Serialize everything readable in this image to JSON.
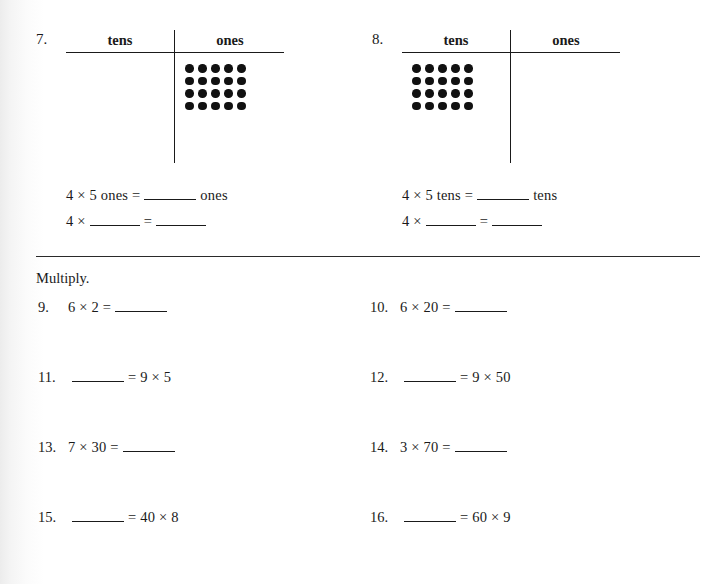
{
  "worksheet": {
    "place_value_problems": [
      {
        "number": "7.",
        "columns": {
          "tens": "tens",
          "ones": "ones"
        },
        "dots": {
          "placed_in": "ones",
          "rows": 4,
          "cols": 5,
          "total": 20
        },
        "equations": [
          {
            "lead": "4 × 5 ones =",
            "blank1": "",
            "trailer": "ones"
          },
          {
            "lead": "4 ×",
            "blank1": "",
            "mid": "=",
            "blank2": ""
          }
        ]
      },
      {
        "number": "8.",
        "columns": {
          "tens": "tens",
          "ones": "ones"
        },
        "dots": {
          "placed_in": "tens",
          "rows": 4,
          "cols": 5,
          "total": 20
        },
        "equations": [
          {
            "lead": "4 × 5 tens =",
            "blank1": "",
            "trailer": "tens"
          },
          {
            "lead": "4 ×",
            "blank1": "",
            "mid": "=",
            "blank2": ""
          }
        ]
      }
    ],
    "multiply_section": {
      "instruction": "Multiply.",
      "problems": [
        {
          "number": "9.",
          "before_blank": "6 × 2 =",
          "after_blank": ""
        },
        {
          "number": "10.",
          "before_blank": "6 × 20 =",
          "after_blank": ""
        },
        {
          "number": "11.",
          "before_blank": "",
          "after_blank": "= 9 × 5"
        },
        {
          "number": "12.",
          "before_blank": "",
          "after_blank": "= 9 × 50"
        },
        {
          "number": "13.",
          "before_blank": "7 × 30 =",
          "after_blank": ""
        },
        {
          "number": "14.",
          "before_blank": "3 × 70 =",
          "after_blank": ""
        },
        {
          "number": "15.",
          "before_blank": "",
          "after_blank": "= 40 × 8"
        },
        {
          "number": "16.",
          "before_blank": "",
          "after_blank": "= 60 × 9"
        }
      ]
    },
    "colors": {
      "ink": "#1a1a1a",
      "dot": "#111111",
      "rule": "#2a2a2a",
      "paper": "#ffffff"
    }
  }
}
